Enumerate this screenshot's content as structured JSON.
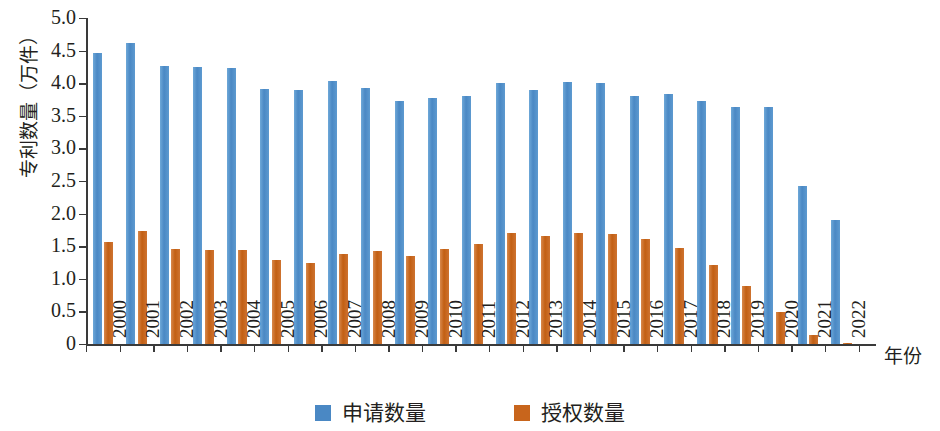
{
  "chart_data": {
    "type": "bar",
    "title": "",
    "xlabel": "年份",
    "ylabel": "专利数量（万件）",
    "ylim": [
      0,
      5.0
    ],
    "ytick_labels": [
      "0",
      "0.5",
      "1.0",
      "1.5",
      "2.0",
      "2.5",
      "3.0",
      "3.5",
      "4.0",
      "4.5",
      "5.0"
    ],
    "ytick_values": [
      0,
      0.5,
      1.0,
      1.5,
      2.0,
      2.5,
      3.0,
      3.5,
      4.0,
      4.5,
      5.0
    ],
    "grid": false,
    "legend_position": "bottom-center",
    "categories": [
      "2000",
      "2001",
      "2002",
      "2003",
      "2004",
      "2005",
      "2006",
      "2007",
      "2008",
      "2009",
      "2010",
      "2011",
      "2012",
      "2013",
      "2014",
      "2015",
      "2016",
      "2017",
      "2018",
      "2019",
      "2020",
      "2021",
      "2022"
    ],
    "series": [
      {
        "name": "申请数量",
        "color": "#4a88c4",
        "values": [
          4.46,
          4.62,
          4.26,
          4.25,
          4.23,
          3.91,
          3.9,
          4.04,
          3.92,
          3.73,
          3.77,
          3.81,
          4.0,
          3.9,
          4.02,
          4.01,
          3.8,
          3.84,
          3.72,
          3.64,
          3.64,
          2.42,
          1.9
        ]
      },
      {
        "name": "授权数量",
        "color": "#c8651c",
        "values": [
          1.57,
          1.74,
          1.46,
          1.44,
          1.44,
          1.29,
          1.25,
          1.38,
          1.42,
          1.35,
          1.45,
          1.54,
          1.7,
          1.66,
          1.71,
          1.69,
          1.61,
          1.47,
          1.21,
          0.89,
          0.49,
          0.14,
          0.02
        ]
      }
    ]
  },
  "legend": {
    "items": [
      {
        "label": "申请数量",
        "color": "#4a88c4",
        "swatch": "legend-swatch-apply"
      },
      {
        "label": "授权数量",
        "color": "#c8651c",
        "swatch": "legend-swatch-grant"
      }
    ]
  },
  "axes": {
    "y_title": "专利数量（万件）",
    "x_title": "年份"
  },
  "colors": {
    "series_apply": "#4a88c4",
    "series_grant": "#c8651c",
    "axis": "#3a3a3a",
    "text": "#231f20",
    "background": "#ffffff"
  }
}
